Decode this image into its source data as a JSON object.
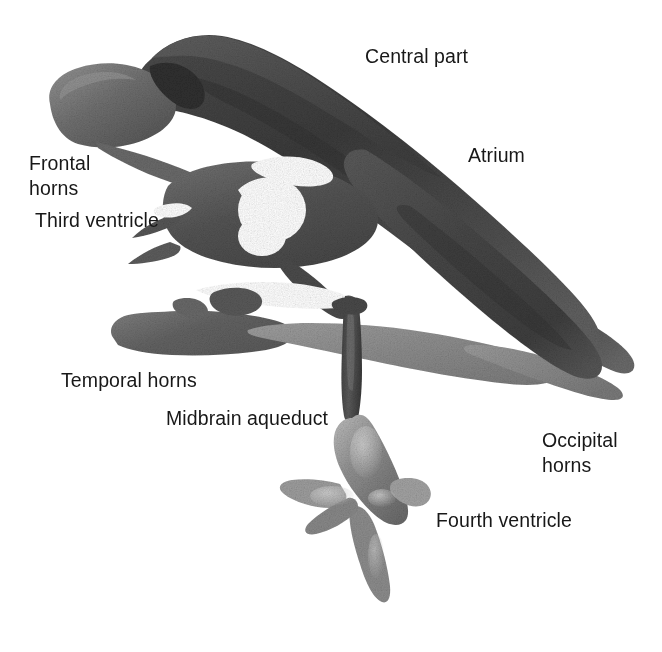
{
  "figure": {
    "kind": "anatomical-illustration",
    "background_color": "#ffffff",
    "ink_color": "#181818"
  },
  "labels": [
    {
      "id": "central-part",
      "text": "Central part",
      "x": 365,
      "y": 44,
      "lines": [
        "Central part"
      ]
    },
    {
      "id": "atrium",
      "text": "Atrium",
      "x": 468,
      "y": 143,
      "lines": [
        "Atrium"
      ]
    },
    {
      "id": "frontal-horns",
      "text": "Frontal\nhorns",
      "x": 29,
      "y": 151,
      "lines": [
        "Frontal",
        "horns"
      ]
    },
    {
      "id": "third-ventricle",
      "text": "Third ventricle",
      "x": 35,
      "y": 208,
      "lines": [
        "Third ventricle"
      ]
    },
    {
      "id": "temporal-horns",
      "text": "Temporal horns",
      "x": 61,
      "y": 368,
      "lines": [
        "Temporal horns"
      ]
    },
    {
      "id": "midbrain-aqueduct",
      "text": "Midbrain aqueduct",
      "x": 166,
      "y": 406,
      "lines": [
        "Midbrain aqueduct"
      ]
    },
    {
      "id": "occipital-horns",
      "text": "Occipital\nhorns",
      "x": 542,
      "y": 428,
      "lines": [
        "Occipital",
        "horns"
      ]
    },
    {
      "id": "fourth-ventricle",
      "text": "Fourth ventricle",
      "x": 436,
      "y": 508,
      "lines": [
        "Fourth ventricle"
      ]
    }
  ],
  "label_text": {
    "central_part": "Central part",
    "atrium": "Atrium",
    "frontal_horns": "Frontal\nhorns",
    "third_ventricle": "Third ventricle",
    "temporal_horns": "Temporal horns",
    "midbrain_aqueduct": "Midbrain aqueduct",
    "occipital_horns": "Occipital\nhorns",
    "fourth_ventricle": "Fourth ventricle"
  },
  "palette": {
    "darkest": "#3a3a3a",
    "dark": "#4d4d4d",
    "mid_dark": "#5c5c5c",
    "mid": "#6b6b6b",
    "mid_light": "#7d7d7d",
    "light": "#909090",
    "lightest": "#a8a8a8",
    "highlight": "#c9c9c9",
    "background": "#ffffff"
  },
  "structures": [
    {
      "name": "frontal-horn-lobe",
      "tone": "#6b6b6b"
    },
    {
      "name": "central-part-body",
      "tone": "#3f3f3f"
    },
    {
      "name": "atrium-body",
      "tone": "#4a4a4a"
    },
    {
      "name": "occipital-horn-upper",
      "tone": "#4d4d4d"
    },
    {
      "name": "occipital-horn-lower",
      "tone": "#8a8a8a"
    },
    {
      "name": "temporal-horn-left",
      "tone": "#6e6e6e"
    },
    {
      "name": "temporal-horn-right",
      "tone": "#8d8d8d"
    },
    {
      "name": "third-ventricle",
      "tone": "#555555"
    },
    {
      "name": "foramen-hole",
      "tone": "#ffffff"
    },
    {
      "name": "midbrain-aqueduct",
      "tone": "#4e4e4e"
    },
    {
      "name": "fourth-ventricle",
      "tone": "#8b8b8b"
    }
  ]
}
